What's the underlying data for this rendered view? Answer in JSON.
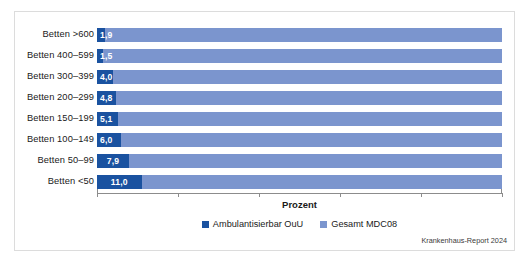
{
  "chart_data": {
    "type": "bar",
    "orientation": "horizontal",
    "stacked": true,
    "title": "",
    "xlabel": "Prozent",
    "ylabel": "",
    "xlim": [
      0,
      100
    ],
    "xticks": [
      0,
      20,
      40,
      60,
      80,
      100
    ],
    "grid": false,
    "legend_position": "bottom-center",
    "categories": [
      "Betten >600",
      "Betten 400–599",
      "Betten 300–399",
      "Betten 200–299",
      "Betten 150–199",
      "Betten 100–149",
      "Betten 50–99",
      "Betten <50"
    ],
    "series": [
      {
        "name": "Ambulantisierbar OuU",
        "color": "#1a52a0",
        "values": [
          1.9,
          1.5,
          4.0,
          4.8,
          5.1,
          6.0,
          7.9,
          11.0
        ],
        "labels": [
          "1,9",
          "1,5",
          "4,0",
          "4,8",
          "5,1",
          "6,0",
          "7,9",
          "11,0"
        ]
      },
      {
        "name": "Gesamt MDC08",
        "color": "#7b95ce",
        "values": [
          100,
          100,
          100,
          100,
          100,
          100,
          100,
          100
        ],
        "labels": [
          "",
          "",
          "",
          "",
          "",
          "",
          "",
          ""
        ]
      }
    ],
    "source_note": "Krankenhaus-Report 2024"
  },
  "colors": {
    "series_dark": "#1a52a0",
    "series_light": "#7b95ce",
    "axis": "#8c8c8c",
    "frame": "#dcdcdc",
    "text": "#1a1a1a",
    "background": "#ffffff"
  }
}
